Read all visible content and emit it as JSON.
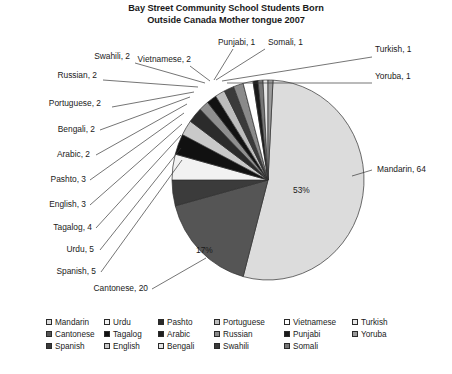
{
  "chart_data": {
    "type": "pie",
    "title": "Bay Street Community School Students Born Outside Canada Mother tongue 2007",
    "title_line1": "Bay Street Community School Students Born",
    "title_line2": "Outside Canada Mother tongue 2007",
    "total": 120,
    "categories": [
      "Mandarin",
      "Cantonese",
      "Spanish",
      "Urdu",
      "Tagalog",
      "English",
      "Pashto",
      "Arabic",
      "Bengali",
      "Portuguese",
      "Russian",
      "Swahili",
      "Vietnamese",
      "Punjabi",
      "Somali",
      "Turkish",
      "Yoruba"
    ],
    "values": [
      64,
      20,
      5,
      5,
      4,
      3,
      3,
      2,
      2,
      2,
      2,
      2,
      2,
      1,
      1,
      1,
      1
    ],
    "colors": [
      "#dcdcdc",
      "#555555",
      "#3b3b3b",
      "#f2f2f2",
      "#111111",
      "#c9c9c9",
      "#2b2b2b",
      "#8f8f8f",
      "#121212",
      "#bdbdbd",
      "#3a3a3a",
      "#8a8a8a",
      "#ffffff",
      "#1a1a1a",
      "#777777",
      "#e6e6e6",
      "#9a9a9a"
    ],
    "slice_labels": [
      "53%",
      "17%"
    ],
    "legend_position": "bottom",
    "grid": false,
    "callout_labels": [
      {
        "name": "Mandarin",
        "value": 64,
        "text": "Mandarin, 64"
      },
      {
        "name": "Cantonese",
        "value": 20,
        "text": "Cantonese, 20"
      },
      {
        "name": "Spanish",
        "value": 5,
        "text": "Spanish, 5"
      },
      {
        "name": "Urdu",
        "value": 5,
        "text": "Urdu, 5"
      },
      {
        "name": "Tagalog",
        "value": 4,
        "text": "Tagalog, 4"
      },
      {
        "name": "English",
        "value": 3,
        "text": "English, 3"
      },
      {
        "name": "Pashto",
        "value": 3,
        "text": "Pashto, 3"
      },
      {
        "name": "Arabic",
        "value": 2,
        "text": "Arabic, 2"
      },
      {
        "name": "Bengali",
        "value": 2,
        "text": "Bengali, 2"
      },
      {
        "name": "Portuguese",
        "value": 2,
        "text": "Portuguese, 2"
      },
      {
        "name": "Russian",
        "value": 2,
        "text": "Russian, 2"
      },
      {
        "name": "Swahili",
        "value": 2,
        "text": "Swahili, 2"
      },
      {
        "name": "Vietnamese",
        "value": 2,
        "text": "Vietnamese, 2"
      },
      {
        "name": "Punjabi",
        "value": 1,
        "text": "Punjabi, 1"
      },
      {
        "name": "Somali",
        "value": 1,
        "text": "Somali, 1"
      },
      {
        "name": "Turkish",
        "value": 1,
        "text": "Turkish, 1"
      },
      {
        "name": "Yoruba",
        "value": 1,
        "text": "Yoruba, 1"
      }
    ]
  },
  "labels": {
    "punjabi": "Punjabi, 1",
    "somali": "Somali, 1",
    "turkish": "Turkish, 1",
    "yoruba": "Yoruba, 1",
    "vietnamese": "Vietnamese, 2",
    "swahili": "Swahili, 2",
    "russian": "Russian, 2",
    "portuguese": "Portuguese, 2",
    "bengali": "Bengali, 2",
    "arabic": "Arabic, 2",
    "pashto": "Pashto, 3",
    "english": "English, 3",
    "tagalog": "Tagalog, 4",
    "urdu": "Urdu, 5",
    "spanish": "Spanish, 5",
    "cantonese": "Cantonese, 20",
    "mandarin": "Mandarin, 64",
    "pct_mandarin": "53%",
    "pct_cantonese": "17%"
  },
  "legend": {
    "columns": [
      [
        {
          "label": "Mandarin",
          "color": "#dcdcdc"
        },
        {
          "label": "Cantonese",
          "color": "#555555"
        },
        {
          "label": "Spanish",
          "color": "#3b3b3b"
        }
      ],
      [
        {
          "label": "Urdu",
          "color": "#f2f2f2"
        },
        {
          "label": "Tagalog",
          "color": "#111111"
        },
        {
          "label": "English",
          "color": "#c9c9c9"
        }
      ],
      [
        {
          "label": "Pashto",
          "color": "#2b2b2b"
        },
        {
          "label": "Arabic",
          "color": "#1f1f1f"
        },
        {
          "label": "Bengali",
          "color": "#e4e4e4"
        }
      ],
      [
        {
          "label": "Portuguese",
          "color": "#bdbdbd"
        },
        {
          "label": "Russian",
          "color": "#8a8a8a"
        },
        {
          "label": "Swahili",
          "color": "#3a3a3a"
        }
      ],
      [
        {
          "label": "Vietnamese",
          "color": "#ffffff"
        },
        {
          "label": "Punjabi",
          "color": "#1a1a1a"
        },
        {
          "label": "Somali",
          "color": "#777777"
        }
      ],
      [
        {
          "label": "Turkish",
          "color": "#e6e6e6"
        },
        {
          "label": "Yoruba",
          "color": "#9a9a9a"
        }
      ]
    ]
  },
  "caption": {
    "text": ""
  }
}
